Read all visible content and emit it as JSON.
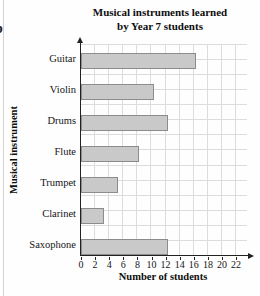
{
  "page": {
    "cropped_label": "b",
    "title_line1": "Musical instruments learned",
    "title_line2": "by Year 7 students"
  },
  "chart_data": {
    "type": "bar",
    "orientation": "horizontal",
    "title": "Musical instruments learned by Year 7 students",
    "categories": [
      "Guitar",
      "Violin",
      "Drums",
      "Flute",
      "Trumpet",
      "Clarinet",
      "Saxophone"
    ],
    "values": [
      16,
      10,
      12,
      8,
      5,
      3,
      12
    ],
    "xlabel": "Number of students",
    "ylabel": "Musical instrument",
    "xlim": [
      0,
      22
    ],
    "x_ticks": [
      0,
      2,
      4,
      6,
      8,
      10,
      12,
      14,
      16,
      18,
      20,
      22
    ],
    "grid": true,
    "legend": "none",
    "bar_color": "#c9c9c9",
    "bar_border_color": "#8c8c8c",
    "grid_color": "#dcdcdc",
    "axis_color": "#222222"
  }
}
